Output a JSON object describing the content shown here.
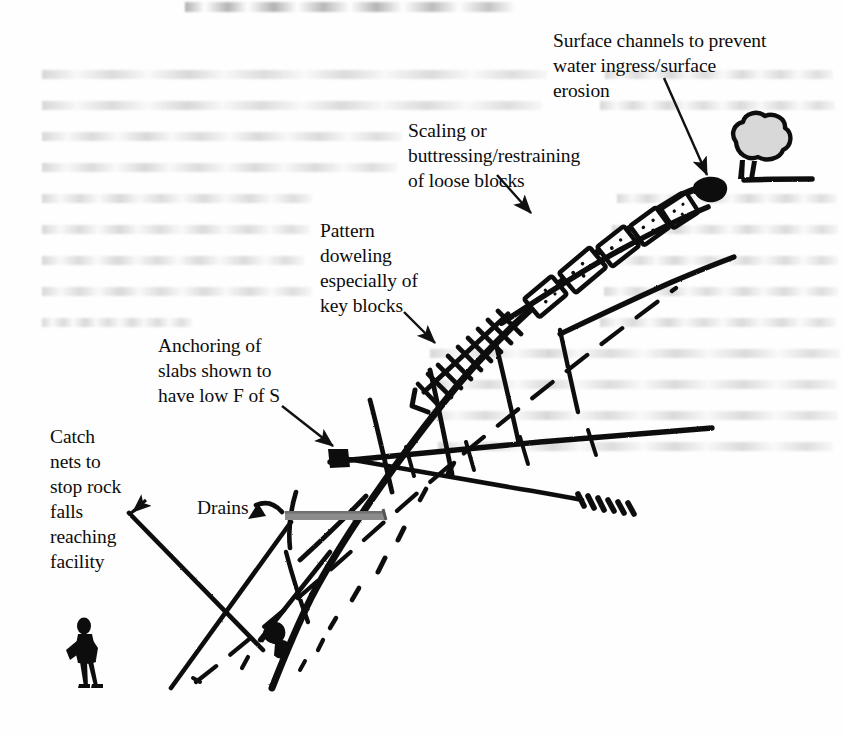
{
  "figure": {
    "type": "hand-drawn engineering section diagram",
    "background_color": "#fefefe",
    "ink_color": "#111111",
    "drain_color": "#8c8c8c",
    "tree_canopy_color": "#d8d8d8"
  },
  "annotations": {
    "surface_channels": {
      "text": "Surface channels to prevent\nwater ingress/surface\nerosion",
      "x": 553,
      "y": 28
    },
    "scaling": {
      "text": "Scaling or\nbuttressing/restraining\nof loose blocks",
      "x": 408,
      "y": 118
    },
    "doweling": {
      "text": "Pattern\ndoweling\nespecially of\nkey blocks",
      "x": 320,
      "y": 218
    },
    "anchoring": {
      "text": "Anchoring of\nslabs shown to\nhave low F of S",
      "x": 158,
      "y": 333
    },
    "catch_nets": {
      "text": "Catch\nnets to\nstop rock\nfalls\nreaching\nfacility",
      "x": 50,
      "y": 424
    },
    "drains": {
      "text": "Drains",
      "x": 197,
      "y": 495
    }
  },
  "elements": {
    "tree": "tree-at-crest",
    "person": "person-silhouette-at-toe",
    "loose_blocks_count": 5,
    "dowel_rungs_count": 9,
    "drain_bar": "grey-horizontal-drain",
    "anchor_block": "dark-square-anchor-head",
    "rock_bolt": "long-anchor-with-threaded-tip",
    "debris": "scattered-rockfall-dashes",
    "ground_line": "horizontal-ground-at-toe"
  },
  "ghost_text": {
    "note": "illegible scanned bleed-through from reverse page",
    "lines_left": 9,
    "lines_right": 7
  }
}
